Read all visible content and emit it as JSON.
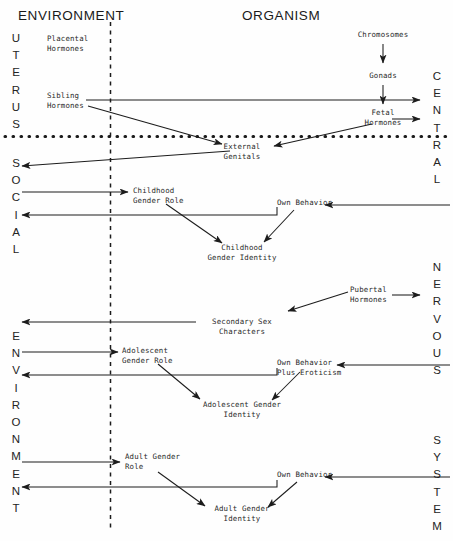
{
  "diagram": {
    "title_environment": "ENVIRONMENT",
    "title_organism": "ORGANISM",
    "edge_labels": {
      "uterus": "UTERUS",
      "social": "SOCIAL",
      "environment": "ENVIRONMENT",
      "central": "CENTRAL",
      "nervous": "NERVOUS",
      "system": "SYSTEM"
    },
    "nodes": {
      "placental_hormones": "Placental\nHormones",
      "sibling_hormones": "Sibling\nHormones",
      "chromosomes": "Chromosomes",
      "gonads": "Gonads",
      "fetal_hormones": "Fetal\nHormones",
      "external_genitals": "External\nGenitals",
      "childhood_gender_role": "Childhood\nGender Role",
      "childhood_gender_identity": "Childhood\nGender Identity",
      "own_behavior_child": "Own Behavior",
      "pubertal_hormones": "Pubertal\nHormones",
      "secondary_sex_characters": "Secondary Sex\nCharacters",
      "adolescent_gender_role": "Adolescent\nGender Role",
      "adolescent_gender_identity": "Adolescent Gender\nIdentity",
      "own_behavior_adolescent": "Own Behavior\nPlus Eroticism",
      "adult_gender_role": "Adult Gender\nRole",
      "adult_gender_identity": "Adult Gender\nIdentity",
      "own_behavior_adult": "Own Behavior"
    },
    "colors": {
      "ink": "#1c1c1c",
      "paper": "#fefefe",
      "label": "#2a2a2a"
    }
  }
}
